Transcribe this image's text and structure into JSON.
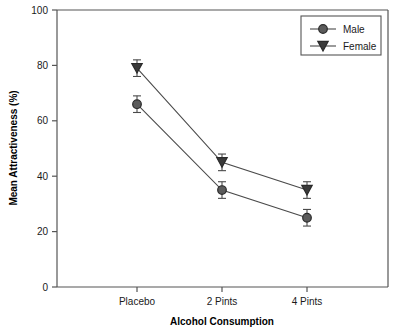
{
  "chart_data": {
    "type": "line",
    "title": "",
    "xlabel": "Alcohol Consumption",
    "ylabel": "Mean Attractiveness (%)",
    "categories": [
      "Placebo",
      "2 Pints",
      "4 Pints"
    ],
    "ylim": [
      0,
      100
    ],
    "yticks": [
      0,
      20,
      40,
      60,
      80,
      100
    ],
    "ytick_labels": [
      "0",
      "20",
      "40",
      "60",
      "80",
      "100"
    ],
    "grid": false,
    "legend_position": "top-right",
    "error_bars": "standard error",
    "series": [
      {
        "name": "Male",
        "marker": "circle",
        "color": "#5b5b5b",
        "values": [
          66,
          35,
          25
        ],
        "errors": [
          3,
          3,
          3
        ]
      },
      {
        "name": "Female",
        "marker": "triangle-down",
        "color": "#3a3a3a",
        "values": [
          79,
          45,
          35
        ],
        "errors": [
          3,
          3,
          3
        ]
      }
    ]
  },
  "axes": {
    "y_title": "Mean Attractiveness (%)",
    "x_title": "Alcohol Consumption"
  },
  "legend": {
    "entries": [
      {
        "label": "Male",
        "marker": "circle-marker"
      },
      {
        "label": "Female",
        "marker": "triangle-down-marker"
      }
    ]
  },
  "colors": {
    "axis": "#555555",
    "male": "#5b5b5b",
    "female": "#3a3a3a",
    "marker_stroke": "#2a2a2a",
    "text": "#1a1a1a",
    "background": "#ffffff"
  }
}
